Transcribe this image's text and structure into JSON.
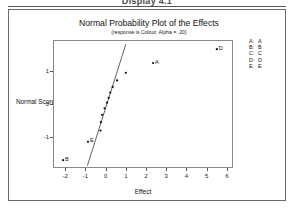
{
  "page": {
    "header_text": "Display 4.1"
  },
  "chart": {
    "title": "Normal Probability Plot of the Effects",
    "subtitle": "(response is Colour, Alpha = .20)"
  },
  "legend": {
    "rows": [
      {
        "key": "A:",
        "label": "A"
      },
      {
        "key": "B:",
        "label": "B"
      },
      {
        "key": "C:",
        "label": "C"
      },
      {
        "key": "D:",
        "label": "D"
      },
      {
        "key": "E:",
        "label": "E"
      }
    ]
  },
  "chart_data": {
    "type": "scatter",
    "title": "Normal Probability Plot of the Effects",
    "subtitle": "(response is Colour, Alpha = .20)",
    "xlabel": "Effect",
    "ylabel": "Normal Score",
    "xlim": [
      -2.6,
      6.3
    ],
    "ylim": [
      -1.95,
      1.95
    ],
    "xticks": [
      -2,
      -1,
      0,
      1,
      2,
      3,
      4,
      5,
      6
    ],
    "xticklabels": [
      "-2",
      "-1",
      "0",
      "1",
      "2",
      "3",
      "4",
      "5",
      "6"
    ],
    "yticks": [
      -1,
      0,
      1
    ],
    "yticklabels": [
      "-1",
      "0",
      "1"
    ],
    "grid": false,
    "legend_position": "right",
    "points": [
      {
        "x": -2.15,
        "y": -1.68,
        "label": "B"
      },
      {
        "x": -0.92,
        "y": -1.12,
        "label": "E"
      },
      {
        "x": -0.3,
        "y": -0.78,
        "label": ""
      },
      {
        "x": -0.28,
        "y": -0.52,
        "label": ""
      },
      {
        "x": -0.22,
        "y": -0.3,
        "label": ""
      },
      {
        "x": -0.1,
        "y": -0.1,
        "label": ""
      },
      {
        "x": 0.02,
        "y": 0.07,
        "label": ""
      },
      {
        "x": 0.1,
        "y": 0.22,
        "label": ""
      },
      {
        "x": 0.18,
        "y": 0.38,
        "label": ""
      },
      {
        "x": 0.3,
        "y": 0.55,
        "label": ""
      },
      {
        "x": 0.52,
        "y": 0.75,
        "label": ""
      },
      {
        "x": 0.95,
        "y": 0.98,
        "label": ""
      },
      {
        "x": 2.3,
        "y": 1.28,
        "label": "A"
      },
      {
        "x": 5.45,
        "y": 1.7,
        "label": "D"
      }
    ],
    "fit_line": {
      "x1": -0.95,
      "y1": -1.85,
      "x2": 0.95,
      "y2": 1.85
    },
    "series": [
      {
        "name": "effects",
        "x": [
          -2.15,
          -0.92,
          -0.3,
          -0.28,
          -0.22,
          -0.1,
          0.02,
          0.1,
          0.18,
          0.3,
          0.52,
          0.95,
          2.3,
          5.45
        ],
        "values": [
          -1.68,
          -1.12,
          -0.78,
          -0.52,
          -0.3,
          -0.1,
          0.07,
          0.22,
          0.38,
          0.55,
          0.75,
          0.98,
          1.28,
          1.7
        ]
      }
    ],
    "labeled_points": [
      "A",
      "B",
      "D",
      "E"
    ]
  }
}
